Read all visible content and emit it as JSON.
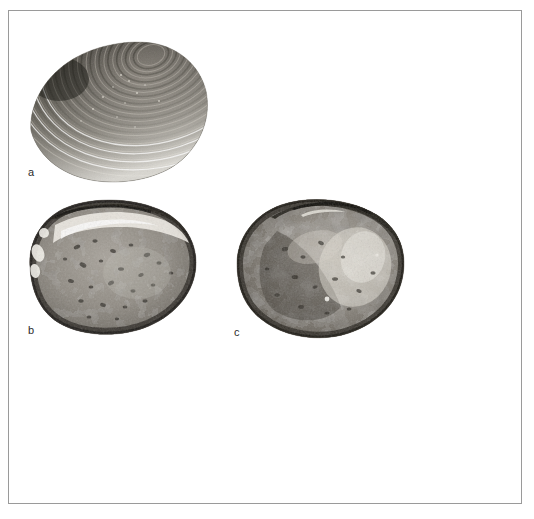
{
  "figure": {
    "type": "photographic-plate",
    "background_color": "#ffffff",
    "frame_color": "#9a9a9a",
    "caption": "",
    "panels": [
      {
        "id": "a",
        "label": "a",
        "name": "shell-specimen-a",
        "view": "exterior",
        "description": "Dark bivalve shell exterior with dense concentric growth ridges, umbo at upper right, fan-shaped outline",
        "dominant_color": "#3a3a3a",
        "highlight_color": "#d8d8d4",
        "position": {
          "x": 16,
          "y": 24,
          "width": 185,
          "height": 145
        }
      },
      {
        "id": "b",
        "label": "b",
        "name": "shell-specimen-b",
        "view": "interior",
        "description": "Oval bivalve shell interior, mottled grey surface with dark speckles, dark hinge margin along upper edge and light band below it",
        "dominant_color": "#8e8e8e",
        "rim_color": "#3c3c3c",
        "position": {
          "x": 16,
          "y": 184,
          "width": 175,
          "height": 142
        }
      },
      {
        "id": "c",
        "label": "c",
        "name": "shell-specimen-c",
        "view": "interior",
        "description": "Rounded triangular bivalve shell interior, mottled light and dark grey surface, dark hinge margin across top",
        "dominant_color": "#8a8a8a",
        "rim_color": "#343434",
        "position": {
          "x": 222,
          "y": 184,
          "width": 178,
          "height": 144
        }
      }
    ]
  }
}
